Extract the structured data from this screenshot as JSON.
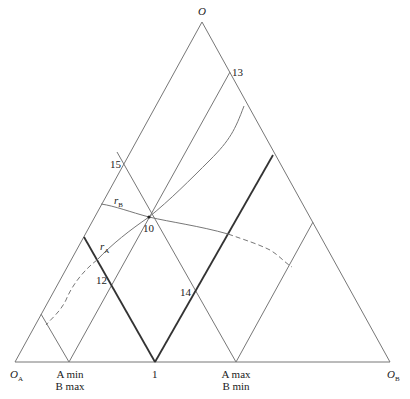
{
  "diagram": {
    "type": "ternary-region-diagram",
    "vertices": {
      "top": "O",
      "left": {
        "main": "O",
        "sub": "A"
      },
      "right": {
        "main": "O",
        "sub": "B"
      }
    },
    "base_labels": {
      "a_min_b_max": {
        "line1": "A min",
        "line2": "B max"
      },
      "point_1": "1",
      "a_max_b_min": {
        "line1": "A max",
        "line2": "B min"
      }
    },
    "point_labels": {
      "p10": "10",
      "p12": "12",
      "p13": "13",
      "p14": "14",
      "p15": "15"
    },
    "curve_labels": {
      "rA": {
        "main": "r",
        "sub": "A"
      },
      "rB": {
        "main": "r",
        "sub": "B"
      }
    },
    "colors": {
      "line": "#6a6a6a",
      "thick_line": "#333333",
      "text": "#222222"
    }
  }
}
